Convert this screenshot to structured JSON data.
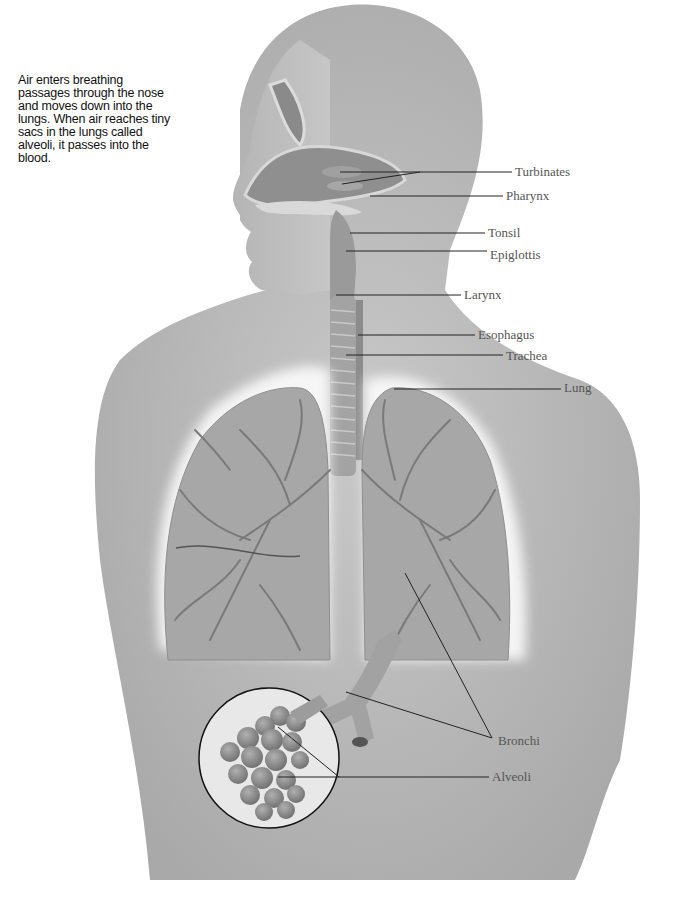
{
  "caption": "Air enters breathing passages through the nose and moves down into the lungs. When air reaches tiny sacs in the lungs called alveoli, it passes into the blood.",
  "colors": {
    "background": "#ffffff",
    "body_fill": "#bdbdbd",
    "body_dark": "#9a9a9a",
    "lung_fill": "#a9a9a9",
    "vessel": "#777777",
    "leader_line": "#222222",
    "label_text": "#555555",
    "caption_text": "#111111"
  },
  "labels": [
    {
      "id": "turbinates",
      "text": "Turbinates",
      "x": 515,
      "y": 165
    },
    {
      "id": "pharynx",
      "text": "Pharynx",
      "x": 506,
      "y": 189
    },
    {
      "id": "tonsil",
      "text": "Tonsil",
      "x": 488,
      "y": 226
    },
    {
      "id": "epiglottis",
      "text": "Epiglottis",
      "x": 490,
      "y": 248
    },
    {
      "id": "larynx",
      "text": "Larynx",
      "x": 464,
      "y": 288
    },
    {
      "id": "esophagus",
      "text": "Esophagus",
      "x": 478,
      "y": 328
    },
    {
      "id": "trachea",
      "text": "Trachea",
      "x": 506,
      "y": 349
    },
    {
      "id": "lung",
      "text": "Lung",
      "x": 564,
      "y": 381
    },
    {
      "id": "bronchi",
      "text": "Bronchi",
      "x": 498,
      "y": 734
    },
    {
      "id": "alveoli",
      "text": "Alveoli",
      "x": 492,
      "y": 770
    }
  ],
  "leader_lines": [
    {
      "to": "turbinates",
      "points": [
        [
          340,
          172
        ],
        [
          420,
          172
        ],
        [
          512,
          172
        ]
      ]
    },
    {
      "to": "turbinates",
      "points": [
        [
          342,
          184
        ],
        [
          420,
          172
        ]
      ]
    },
    {
      "to": "pharynx",
      "points": [
        [
          370,
          196
        ],
        [
          503,
          196
        ]
      ]
    },
    {
      "to": "tonsil",
      "points": [
        [
          350,
          233
        ],
        [
          485,
          233
        ]
      ]
    },
    {
      "to": "epiglottis",
      "points": [
        [
          346,
          251
        ],
        [
          487,
          251
        ]
      ]
    },
    {
      "to": "larynx",
      "points": [
        [
          336,
          295
        ],
        [
          461,
          295
        ]
      ]
    },
    {
      "to": "esophagus",
      "points": [
        [
          358,
          335
        ],
        [
          475,
          335
        ]
      ]
    },
    {
      "to": "trachea",
      "points": [
        [
          346,
          355
        ],
        [
          503,
          355
        ]
      ]
    },
    {
      "to": "lung",
      "points": [
        [
          394,
          389
        ],
        [
          561,
          389
        ]
      ]
    },
    {
      "to": "bronchi",
      "points": [
        [
          405,
          573
        ],
        [
          492,
          738
        ]
      ]
    },
    {
      "to": "bronchi",
      "points": [
        [
          346,
          692
        ],
        [
          492,
          738
        ]
      ]
    },
    {
      "to": "alveoli",
      "points": [
        [
          278,
          777
        ],
        [
          489,
          777
        ]
      ]
    },
    {
      "to": "alveoli",
      "points": [
        [
          278,
          727
        ],
        [
          339,
          777
        ]
      ]
    }
  ],
  "inset_circle": {
    "cx": 269,
    "cy": 758,
    "r": 70
  }
}
